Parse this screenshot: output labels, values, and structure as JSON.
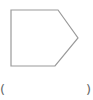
{
  "shape": {
    "type": "pentagon-arrow",
    "points": "11,10 58,10 78,38 55,66 11,66",
    "stroke": "#9a9a9a",
    "fill": "#ffffff"
  },
  "caption": {
    "left": "(",
    "right": ")"
  }
}
